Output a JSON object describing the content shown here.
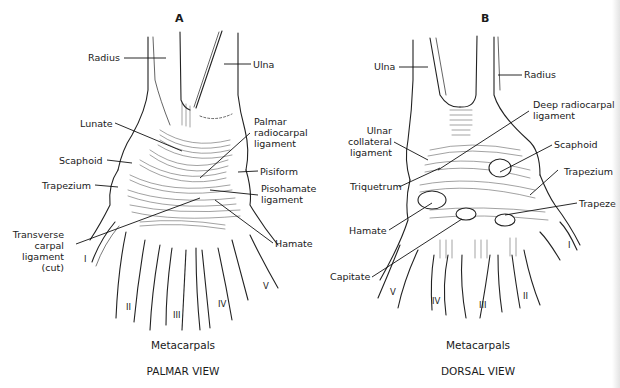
{
  "panels": {
    "a": {
      "letter": "A",
      "view_title": "PALMAR VIEW",
      "group_label": "Metacarpals",
      "labels": {
        "radius": "Radius",
        "ulna": "Ulna",
        "lunate": "Lunate",
        "palmar_radiocarpal_1": "Palmar",
        "palmar_radiocarpal_2": "radiocarpal",
        "palmar_radiocarpal_3": "ligament",
        "scaphoid": "Scaphoid",
        "pisiform": "Pisiform",
        "trapezium": "Trapezium",
        "pisohamate_1": "Pisohamate",
        "pisohamate_2": "ligament",
        "transverse_1": "Transverse",
        "transverse_2": "carpal",
        "transverse_3": "ligament",
        "transverse_4": "(cut)",
        "hamate": "Hamate"
      },
      "metacarpal_numerals": [
        "I",
        "II",
        "III",
        "IV",
        "V"
      ]
    },
    "b": {
      "letter": "B",
      "view_title": "DORSAL VIEW",
      "group_label": "Metacarpals",
      "labels": {
        "ulna": "Ulna",
        "radius": "Radius",
        "deep_radiocarpal_1": "Deep radiocarpal",
        "deep_radiocarpal_2": "ligament",
        "ulnar_collateral_1": "Ulnar",
        "ulnar_collateral_2": "collateral",
        "ulnar_collateral_3": "ligament",
        "scaphoid": "Scaphoid",
        "triquetrum": "Triquetrum",
        "trapezium": "Trapezium",
        "trapezoid_cut": "Trapeze",
        "hamate": "Hamate",
        "capitate": "Capitate"
      },
      "metacarpal_numerals": [
        "V",
        "IV",
        "III",
        "II",
        "I"
      ]
    }
  }
}
